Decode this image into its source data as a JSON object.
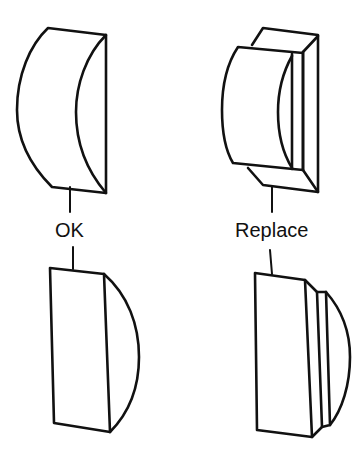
{
  "labels": {
    "ok": "OK",
    "replace": "Replace"
  },
  "figures": [
    {
      "name": "ok-lens-perspective",
      "label_ref": "ok",
      "position": "top-left"
    },
    {
      "name": "replace-lens-perspective",
      "label_ref": "replace",
      "position": "top-right"
    },
    {
      "name": "ok-lens-side",
      "label_ref": "ok",
      "position": "bottom-left"
    },
    {
      "name": "replace-lens-side",
      "label_ref": "replace",
      "position": "bottom-right"
    }
  ],
  "colors": {
    "line": "#111111",
    "background": "#ffffff"
  }
}
